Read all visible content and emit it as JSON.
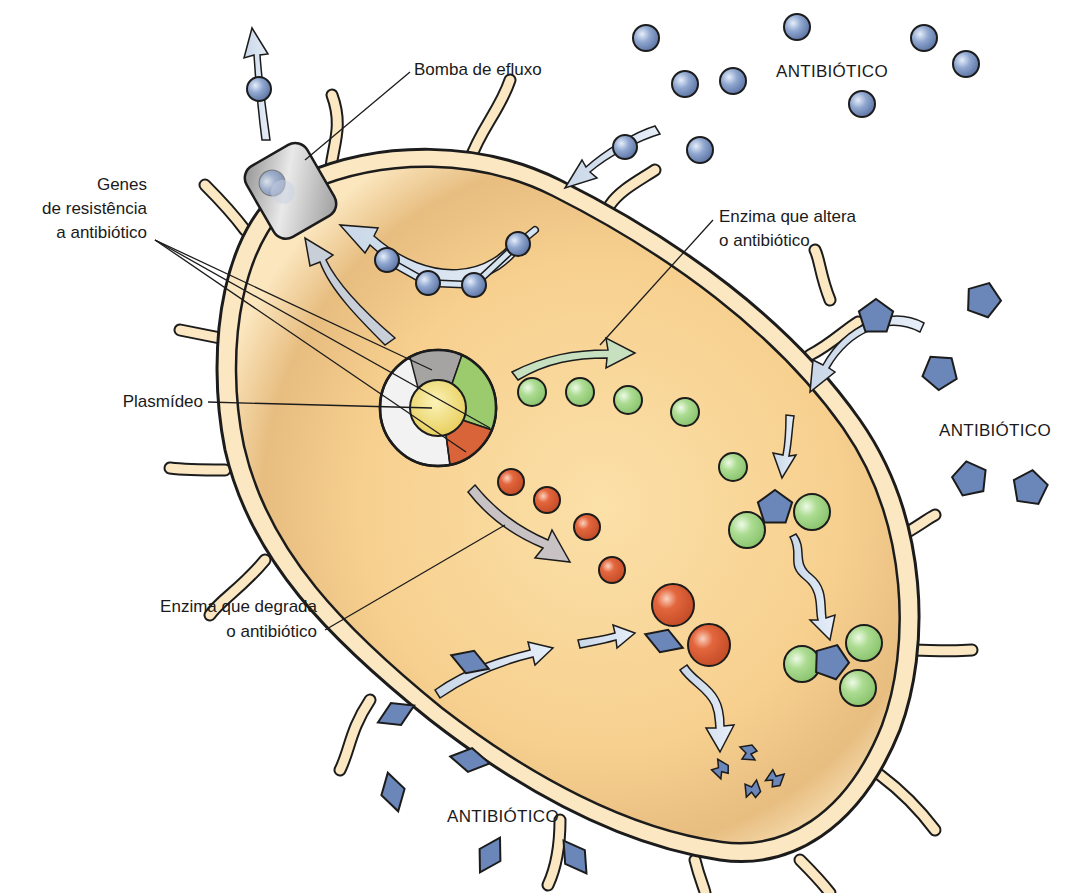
{
  "colors": {
    "cytoplasm": "#f7cf8e",
    "cytoplasm_light": "#fbe3b6",
    "wall": "#fbe8c2",
    "outline": "#1c1c1c",
    "antibiotic_blue": "#6b86b8",
    "arrow_fill": "#d6e4f2",
    "green_enzyme": "#a8d88e",
    "red_enzyme": "#e0623a",
    "pump_gray": "#b8b8b8",
    "plasmid_gray": "#a6a3a3",
    "plasmid_green": "#9ccb6e",
    "plasmid_red": "#d9643a",
    "plasmid_white": "#f2f2f2",
    "plasmid_core": "#f3e07c"
  },
  "labels": {
    "efflux_pump": "Bomba de efluxo",
    "resistance_genes": [
      "Genes",
      "de resistência",
      "a antibiótico"
    ],
    "plasmid": "Plasmídeo",
    "altering_enzyme": [
      "Enzima que altera",
      "o antibiótico"
    ],
    "degrading_enzyme": [
      "Enzima que degrada",
      "o antibiótico"
    ],
    "antibiotic_top": "ANTIBIÓTICO",
    "antibiotic_right": "ANTIBIÓTICO",
    "antibiotic_bottom": "ANTIBIÓTICO"
  },
  "elements": {
    "sphere_antibiotics_outside": [
      [
        646,
        38
      ],
      [
        797,
        27
      ],
      [
        924,
        38
      ],
      [
        966,
        64
      ],
      [
        685,
        84
      ],
      [
        733,
        81
      ],
      [
        862,
        104
      ],
      [
        700,
        150
      ]
    ],
    "sphere_antibiotics_chain": [
      [
        518,
        244
      ],
      [
        474,
        285
      ],
      [
        428,
        283
      ],
      [
        387,
        260
      ]
    ],
    "sphere_antibiotic_pump_exit": [
      [
        259,
        89
      ]
    ],
    "sphere_antibiotic_entering": [
      [
        625,
        147
      ]
    ],
    "pentagon_antibiotics_outside": [
      [
        876,
        317
      ],
      [
        983,
        300
      ],
      [
        940,
        372
      ],
      [
        970,
        479
      ],
      [
        1030,
        488
      ]
    ],
    "pentagon_antibiotics_bound": [
      [
        775,
        508
      ],
      [
        831,
        662
      ]
    ],
    "green_enzymes_free": [
      [
        532,
        392
      ],
      [
        580,
        392
      ],
      [
        628,
        400
      ],
      [
        685,
        412
      ],
      [
        733,
        467
      ]
    ],
    "green_enzymes_bound": [
      [
        747,
        530
      ],
      [
        812,
        512
      ],
      [
        802,
        664
      ],
      [
        864,
        643
      ],
      [
        858,
        688
      ]
    ],
    "red_enzymes_free": [
      [
        511,
        482
      ],
      [
        547,
        500
      ],
      [
        587,
        527
      ],
      [
        612,
        570
      ]
    ],
    "red_enzymes_bound": [
      [
        673,
        605
      ],
      [
        709,
        645
      ]
    ],
    "rhombus_antibiotics_outside": [
      [
        470,
        662
      ],
      [
        396,
        714
      ],
      [
        470,
        760
      ],
      [
        393,
        792
      ],
      [
        490,
        855
      ],
      [
        575,
        857
      ]
    ],
    "rhombus_antibiotic_bound": [
      [
        664,
        641
      ]
    ],
    "fragments": [
      [
        748,
        753
      ],
      [
        720,
        769
      ],
      [
        752,
        789
      ],
      [
        775,
        778
      ]
    ]
  }
}
